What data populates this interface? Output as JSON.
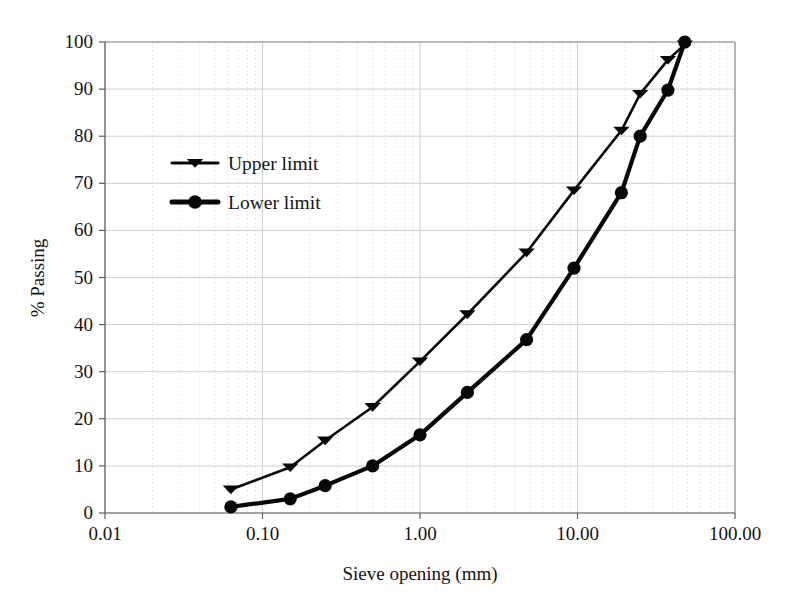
{
  "chart_data": {
    "type": "line",
    "title": "",
    "subtitle": "",
    "xlabel": "Sieve opening (mm)",
    "ylabel": "% Passing",
    "xscale": "log",
    "yscale": "linear",
    "xlim": [
      0.01,
      100.0
    ],
    "ylim": [
      0,
      100
    ],
    "grid": true,
    "legend_position": "upper-left-inside",
    "x_tick_labels": [
      "0.01",
      "0.10",
      "1.00",
      "10.00",
      "100.00"
    ],
    "x_ticks": [
      0.01,
      0.1,
      1.0,
      10.0,
      100.0
    ],
    "y_tick_labels": [
      "0",
      "10",
      "20",
      "30",
      "40",
      "50",
      "60",
      "70",
      "80",
      "90",
      "100"
    ],
    "y_ticks": [
      0,
      10,
      20,
      30,
      40,
      50,
      60,
      70,
      80,
      90,
      100
    ],
    "series": [
      {
        "name": "Upper limit",
        "marker": "triangle",
        "color": "#080808",
        "x": [
          0.063,
          0.15,
          0.25,
          0.5,
          1.0,
          2.0,
          4.75,
          9.5,
          19.0,
          25.0,
          37.5,
          48.0
        ],
        "values": [
          5.0,
          9.7,
          15.4,
          22.5,
          32.2,
          42.2,
          55.3,
          68.5,
          81.2,
          89.0,
          96.2,
          99.5
        ]
      },
      {
        "name": "Lower limit",
        "marker": "circle",
        "color": "#080808",
        "x": [
          0.063,
          0.15,
          0.25,
          0.5,
          1.0,
          2.0,
          4.75,
          9.5,
          19.0,
          25.0,
          37.5,
          48.0
        ],
        "values": [
          1.3,
          3.0,
          5.8,
          10.0,
          16.6,
          25.6,
          36.8,
          52.0,
          68.0,
          80.0,
          89.8,
          100.0
        ]
      }
    ]
  },
  "legend": {
    "items": [
      {
        "label": "Upper limit"
      },
      {
        "label": "Lower limit"
      }
    ]
  },
  "axes": {
    "x_title": "Sieve opening (mm)",
    "y_title": "% Passing"
  }
}
